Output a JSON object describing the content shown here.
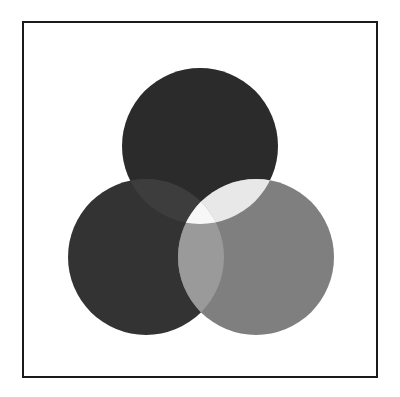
{
  "figure": {
    "background_color": "#ffffff",
    "frame": {
      "name": "border-frame",
      "stroke_color": "#1a1a1a",
      "stroke_width": 2,
      "x": 22,
      "y": 21,
      "width": 356,
      "height": 357,
      "fill_color": "#ffffff"
    }
  },
  "chart_data": {
    "type": "venn",
    "xlabel": "",
    "ylabel": "",
    "set_count": 3,
    "radius": 78,
    "circles": [
      {
        "id": "top",
        "label": "Top circle",
        "cx": 200,
        "cy": 146,
        "r": 78,
        "color": "#2b2b2b",
        "opacity": 1
      },
      {
        "id": "left",
        "label": "Left circle",
        "cx": 146,
        "cy": 257,
        "r": 78,
        "color": "#333333",
        "opacity": 1
      },
      {
        "id": "right",
        "label": "Right circle",
        "cx": 256,
        "cy": 257,
        "r": 78,
        "color": "#7f7f7f",
        "opacity": 1
      }
    ],
    "regions": [
      {
        "id": "top-only",
        "sets": [
          "top"
        ],
        "color": "#2b2b2b"
      },
      {
        "id": "left-only",
        "sets": [
          "left"
        ],
        "color": "#333333"
      },
      {
        "id": "right-only",
        "sets": [
          "right"
        ],
        "color": "#7f7f7f"
      },
      {
        "id": "top-left",
        "sets": [
          "top",
          "left"
        ],
        "color": "#3d3d3d"
      },
      {
        "id": "top-right",
        "sets": [
          "top",
          "right"
        ],
        "color": "#e8e8e8"
      },
      {
        "id": "left-right",
        "sets": [
          "left",
          "right"
        ],
        "color": "#9a9a9a"
      },
      {
        "id": "top-left-right",
        "sets": [
          "top",
          "left",
          "right"
        ],
        "color": "#f7f7f7"
      }
    ],
    "legend": [],
    "annotations": [],
    "grid": false
  }
}
